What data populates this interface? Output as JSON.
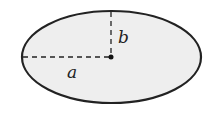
{
  "diagram": {
    "shape": "ellipse",
    "labels": {
      "semi_major": "a",
      "semi_minor": "b"
    },
    "colors": {
      "fill": "#eeeeee",
      "stroke": "#222222"
    }
  }
}
